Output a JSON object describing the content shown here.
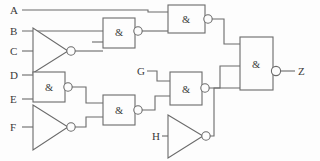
{
  "diagram": {
    "kind": "logic-gate-schematic",
    "stroke_color": "#6b6b6b",
    "text_color": "#3a3a3a",
    "background_color": "#fdfdfd",
    "gate_symbol_standard": "IEC/DIN rectangular",
    "and_symbol_label": "&"
  },
  "inputs": [
    {
      "id": "A",
      "label": "A",
      "x": 10,
      "y": 10
    },
    {
      "id": "B",
      "label": "B",
      "x": 10,
      "y": 31
    },
    {
      "id": "C",
      "label": "C",
      "x": 10,
      "y": 51
    },
    {
      "id": "D",
      "label": "D",
      "x": 10,
      "y": 75
    },
    {
      "id": "E",
      "label": "E",
      "x": 10,
      "y": 99
    },
    {
      "id": "F",
      "label": "F",
      "x": 10,
      "y": 127
    },
    {
      "id": "G",
      "label": "G",
      "x": 137,
      "y": 71
    },
    {
      "id": "H",
      "label": "H",
      "x": 152,
      "y": 136
    }
  ],
  "outputs": [
    {
      "id": "Z",
      "label": "Z",
      "x": 298,
      "y": 71
    }
  ],
  "gates": [
    {
      "id": "INV1",
      "type": "NOT",
      "label": "",
      "inputs": [
        "C"
      ],
      "output": "n1"
    },
    {
      "id": "NAND1",
      "type": "NAND",
      "label": "&",
      "inputs": [
        "B",
        "n1"
      ],
      "output": "n2"
    },
    {
      "id": "NAND2",
      "type": "NAND",
      "label": "&",
      "inputs": [
        "A",
        "n2"
      ],
      "output": "n3"
    },
    {
      "id": "NAND3",
      "type": "NAND",
      "label": "&",
      "inputs": [
        "D",
        "E"
      ],
      "output": "n4"
    },
    {
      "id": "INV2",
      "type": "NOT",
      "label": "",
      "inputs": [
        "F"
      ],
      "output": "n5"
    },
    {
      "id": "NAND4",
      "type": "NAND",
      "label": "&",
      "inputs": [
        "n4",
        "n5"
      ],
      "output": "n6"
    },
    {
      "id": "NAND5",
      "type": "NAND",
      "label": "&",
      "inputs": [
        "G",
        "n6"
      ],
      "output": "n7"
    },
    {
      "id": "INV3",
      "type": "NOT",
      "label": "",
      "inputs": [
        "H"
      ],
      "output": "n8"
    },
    {
      "id": "NAND6",
      "type": "NAND",
      "label": "&",
      "inputs": [
        "n3",
        "n7",
        "n8"
      ],
      "output": "Z"
    }
  ],
  "gate_labels": {
    "nand1": "&",
    "nand2": "&",
    "nand3": "&",
    "nand4": "&",
    "nand5": "&",
    "nand6": "&"
  },
  "net_count": 8
}
